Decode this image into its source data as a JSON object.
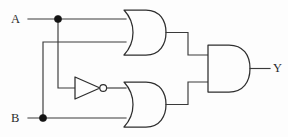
{
  "diagram": {
    "kind": "logic-circuit-schematic",
    "title": "",
    "background_color": "#fdfdfd",
    "line_color": "#3a3a3a",
    "gate_outline_color": "#2e2e2e",
    "junction_color": "#141414",
    "inputs": [
      {
        "id": "A",
        "label": "A",
        "x": 11,
        "y": 13
      },
      {
        "id": "B",
        "label": "B",
        "x": 11,
        "y": 112
      }
    ],
    "outputs": [
      {
        "id": "Y",
        "label": "Y",
        "x": 273,
        "y": 62
      }
    ],
    "gates": [
      {
        "id": "or1",
        "type": "OR",
        "label": "",
        "inputs": [
          "A",
          "B"
        ],
        "output": "or1_out",
        "x": 122,
        "y": 10,
        "width": 44,
        "height": 45
      },
      {
        "id": "not1",
        "type": "NOT",
        "label": "",
        "inputs": [
          "A"
        ],
        "output": "not1_out",
        "x": 75,
        "y": 77,
        "width": 30,
        "height": 22
      },
      {
        "id": "or2",
        "type": "OR",
        "label": "",
        "inputs": [
          "not1_out",
          "B"
        ],
        "output": "or2_out",
        "x": 122,
        "y": 82,
        "width": 44,
        "height": 45
      },
      {
        "id": "and1",
        "type": "AND",
        "label": "",
        "inputs": [
          "or1_out",
          "or2_out"
        ],
        "output": "Y",
        "x": 207,
        "y": 45,
        "width": 43,
        "height": 47
      }
    ],
    "junctions": [
      {
        "id": "node-a",
        "on": "A",
        "x": 58,
        "y": 19,
        "radius": 3.6
      },
      {
        "id": "node-b",
        "on": "B",
        "x": 43,
        "y": 118,
        "radius": 3.6
      }
    ],
    "expression": "Y = (A + B) · (A' + B)"
  }
}
